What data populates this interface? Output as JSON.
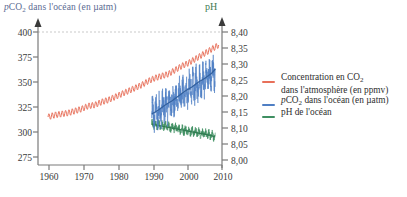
{
  "chart_data": {
    "type": "line",
    "title": "",
    "left_axis": {
      "label": "pCO2 dans l'océan (en µatm)",
      "ticks": [
        275,
        300,
        325,
        350,
        375,
        400
      ],
      "ylim": [
        275,
        400
      ],
      "color": "#5a6a92"
    },
    "right_axis": {
      "label": "pH",
      "ticks": [
        "8,00",
        "8,05",
        "8,10",
        "8,15",
        "8,20",
        "8,25",
        "8,30",
        "8,35",
        "8,40"
      ],
      "ylim": [
        8.0,
        8.4
      ],
      "color": "#3f7a52"
    },
    "xaxis": {
      "label": "",
      "ticks": [
        1960,
        1970,
        1980,
        1990,
        2000,
        2010
      ],
      "xlim": [
        1955,
        2010
      ]
    },
    "grid": "dashed gridline at 400 / 8,40",
    "legend_position": "right",
    "series": [
      {
        "name": "Concentration en CO2 dans l'atmosphère (en ppmv)",
        "color": "#e8705a",
        "axis": "left",
        "x_start": 1958,
        "x_end": 2009,
        "y_start": 315,
        "y_end": 387,
        "seasonal_amplitude": 3.0,
        "values": [
          {
            "x": 1958,
            "y": 315
          },
          {
            "x": 1960,
            "y": 317
          },
          {
            "x": 1962,
            "y": 318
          },
          {
            "x": 1964,
            "y": 319
          },
          {
            "x": 1966,
            "y": 321
          },
          {
            "x": 1968,
            "y": 323
          },
          {
            "x": 1970,
            "y": 326
          },
          {
            "x": 1972,
            "y": 327
          },
          {
            "x": 1974,
            "y": 330
          },
          {
            "x": 1976,
            "y": 332
          },
          {
            "x": 1978,
            "y": 335
          },
          {
            "x": 1980,
            "y": 338
          },
          {
            "x": 1982,
            "y": 341
          },
          {
            "x": 1984,
            "y": 344
          },
          {
            "x": 1986,
            "y": 347
          },
          {
            "x": 1988,
            "y": 351
          },
          {
            "x": 1990,
            "y": 354
          },
          {
            "x": 1992,
            "y": 356
          },
          {
            "x": 1994,
            "y": 358
          },
          {
            "x": 1996,
            "y": 362
          },
          {
            "x": 1998,
            "y": 366
          },
          {
            "x": 2000,
            "y": 369
          },
          {
            "x": 2002,
            "y": 373
          },
          {
            "x": 2004,
            "y": 377
          },
          {
            "x": 2006,
            "y": 381
          },
          {
            "x": 2008,
            "y": 385
          },
          {
            "x": 2009,
            "y": 387
          }
        ]
      },
      {
        "name": "pCO2 dans l'océan (en µatm)",
        "color": "#4f7fc4",
        "axis": "left",
        "x_start": 1989,
        "x_end": 2008,
        "y_start": 318,
        "y_end": 363,
        "noise_amplitude": 26,
        "trend_values": [
          {
            "x": 1989,
            "y": 318
          },
          {
            "x": 1991,
            "y": 322
          },
          {
            "x": 1993,
            "y": 327
          },
          {
            "x": 1995,
            "y": 331
          },
          {
            "x": 1997,
            "y": 336
          },
          {
            "x": 1999,
            "y": 341
          },
          {
            "x": 2001,
            "y": 345
          },
          {
            "x": 2003,
            "y": 350
          },
          {
            "x": 2005,
            "y": 354
          },
          {
            "x": 2007,
            "y": 359
          },
          {
            "x": 2008,
            "y": 363
          }
        ]
      },
      {
        "name": "pH de l'océan",
        "color": "#3f8f62",
        "axis": "right",
        "x_start": 1989,
        "x_end": 2008,
        "y_start": 8.112,
        "y_end": 8.072,
        "noise_amplitude": 0.022,
        "trend_values": [
          {
            "x": 1989,
            "y": 8.112
          },
          {
            "x": 1991,
            "y": 8.108
          },
          {
            "x": 1993,
            "y": 8.104
          },
          {
            "x": 1995,
            "y": 8.1
          },
          {
            "x": 1997,
            "y": 8.096
          },
          {
            "x": 1999,
            "y": 8.092
          },
          {
            "x": 2001,
            "y": 8.088
          },
          {
            "x": 2003,
            "y": 8.084
          },
          {
            "x": 2005,
            "y": 8.08
          },
          {
            "x": 2007,
            "y": 8.076
          },
          {
            "x": 2008,
            "y": 8.072
          }
        ]
      }
    ]
  },
  "left_axis_title": "dans l'océan (en µatm)",
  "left_axis_title_prefix": "p",
  "left_axis_title_co": "CO",
  "left_axis_title_sub": "2",
  "right_axis_title": "pH",
  "left_ticks": [
    "400",
    "375",
    "350",
    "325",
    "300",
    "275"
  ],
  "right_ticks": [
    "8,40",
    "8,35",
    "8,30",
    "8,25",
    "8,20",
    "8,15",
    "8,10",
    "8,05",
    "8,00"
  ],
  "x_ticks": [
    "1960",
    "1970",
    "1980",
    "1990",
    "2000",
    "2010"
  ],
  "legend": {
    "items": [
      {
        "color": "#e8705a",
        "line1": "Concentration en CO",
        "sub1": "2",
        "line2": "dans l'atmosphère (en ppmv)"
      },
      {
        "color": "#4f7fc4",
        "prefix": "p",
        "co": "CO",
        "sub": "2",
        "rest": " dans l'océan (en µatm)"
      },
      {
        "color": "#3f8f62",
        "text": "pH de l'océan"
      }
    ]
  },
  "colors": {
    "co2_atmosphere": "#e8705a",
    "pco2_ocean": "#4f7fc4",
    "ph_ocean": "#3f8f62",
    "axis": "#7a7a7a",
    "grid": "#c9c9c9",
    "text": "#3a3a3a"
  }
}
